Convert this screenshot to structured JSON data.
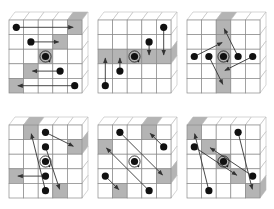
{
  "figure": {
    "width": 274,
    "height": 209,
    "grid_size": 5,
    "cell": 14.6,
    "depth": {
      "dx": 6,
      "dy": -8
    },
    "colors": {
      "line": "#8a8a8a",
      "shade": "#b4b4b4",
      "face": "#ffffff",
      "side_line": "#b8b8b8",
      "dot": "#111111",
      "arrow": "#333333"
    },
    "panels": [
      {
        "id": "panel-1",
        "origin": [
          9,
          20
        ],
        "shaded": [
          [
            4,
            0
          ],
          [
            3,
            1
          ],
          [
            2,
            2
          ],
          [
            1,
            3
          ],
          [
            0,
            4
          ]
        ],
        "top_shaded": [
          4
        ],
        "right_shaded": [],
        "center": [
          2,
          2
        ],
        "arrows": [
          {
            "from": [
              0,
              0
            ],
            "to": [
              4,
              0
            ]
          },
          {
            "from": [
              1,
              1
            ],
            "to": [
              3,
              1
            ]
          },
          {
            "from": [
              3,
              3
            ],
            "to": [
              1,
              3
            ]
          },
          {
            "from": [
              4,
              4
            ],
            "to": [
              0,
              4
            ]
          }
        ]
      },
      {
        "id": "panel-2",
        "origin": [
          98,
          20
        ],
        "shaded": [
          [
            0,
            2
          ],
          [
            1,
            2
          ],
          [
            2,
            2
          ],
          [
            3,
            2
          ],
          [
            4,
            2
          ]
        ],
        "top_shaded": [],
        "right_shaded": [
          2
        ],
        "center": [
          2,
          2
        ],
        "arrows": [
          {
            "from": [
              4,
              0
            ],
            "to": [
              4,
              2
            ]
          },
          {
            "from": [
              3,
              1
            ],
            "to": [
              3,
              2
            ]
          },
          {
            "from": [
              1,
              3
            ],
            "to": [
              1,
              2
            ]
          },
          {
            "from": [
              0,
              4
            ],
            "to": [
              0,
              2
            ]
          }
        ]
      },
      {
        "id": "panel-3",
        "origin": [
          187,
          20
        ],
        "shaded": [
          [
            2,
            0
          ],
          [
            2,
            1
          ],
          [
            2,
            2
          ],
          [
            2,
            3
          ],
          [
            2,
            4
          ]
        ],
        "top_shaded": [
          2
        ],
        "right_shaded": [],
        "center": [
          2,
          2
        ],
        "arrows": [
          {
            "from": [
              0,
              2
            ],
            "to": [
              2,
              1
            ]
          },
          {
            "from": [
              1,
              2
            ],
            "to": [
              2,
              4
            ]
          },
          {
            "from": [
              3,
              2
            ],
            "to": [
              2,
              0
            ]
          },
          {
            "from": [
              4,
              2
            ],
            "to": [
              2,
              3
            ]
          }
        ]
      },
      {
        "id": "panel-4",
        "origin": [
          9,
          125
        ],
        "shaded": [
          [
            1,
            0
          ],
          [
            4,
            1
          ],
          [
            0,
            3
          ],
          [
            3,
            4
          ]
        ],
        "top_shaded": [
          1
        ],
        "right_shaded": [
          1
        ],
        "center": [
          2,
          2
        ],
        "arrows": [
          {
            "from": [
              2,
              0
            ],
            "to": [
              4,
              1
            ]
          },
          {
            "from": [
              2,
              1
            ],
            "to": [
              3,
              4
            ]
          },
          {
            "from": [
              2,
              3
            ],
            "to": [
              0,
              3
            ]
          },
          {
            "from": [
              2,
              4
            ],
            "to": [
              1,
              0
            ]
          }
        ]
      },
      {
        "id": "panel-5",
        "origin": [
          98,
          125
        ],
        "shaded": [
          [
            3,
            0
          ],
          [
            0,
            1
          ],
          [
            4,
            3
          ],
          [
            1,
            4
          ]
        ],
        "top_shaded": [
          3
        ],
        "right_shaded": [
          3
        ],
        "center": [
          2,
          2
        ],
        "arrows": [
          {
            "from": [
              1,
              0
            ],
            "to": [
              4,
              3
            ]
          },
          {
            "from": [
              4,
              1
            ],
            "to": [
              3,
              0
            ]
          },
          {
            "from": [
              3,
              4
            ],
            "to": [
              0,
              1
            ]
          },
          {
            "from": [
              0,
              3
            ],
            "to": [
              1,
              4
            ]
          }
        ]
      },
      {
        "id": "panel-6",
        "origin": [
          187,
          125
        ],
        "shaded": [
          [
            0,
            0
          ],
          [
            1,
            1
          ],
          [
            2,
            2
          ],
          [
            3,
            3
          ],
          [
            4,
            4
          ]
        ],
        "top_shaded": [
          0
        ],
        "right_shaded": [
          4
        ],
        "center": [
          2,
          2
        ],
        "arrows": [
          {
            "from": [
              0,
              1
            ],
            "to": [
              3,
              3
            ]
          },
          {
            "from": [
              4,
              3
            ],
            "to": [
              1,
              1
            ]
          },
          {
            "from": [
              3,
              0
            ],
            "to": [
              4,
              4
            ]
          },
          {
            "from": [
              1,
              4
            ],
            "to": [
              0,
              0
            ]
          }
        ]
      }
    ]
  }
}
